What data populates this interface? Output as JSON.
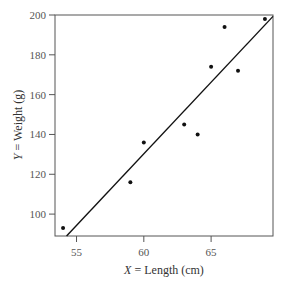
{
  "chart_data": {
    "type": "scatter",
    "title": "",
    "xlabel": "X = Length (cm)",
    "ylabel": "Y = Weight (g)",
    "xlabel_var": "X",
    "xlabel_text": " = Length (cm)",
    "ylabel_var": "Y",
    "ylabel_text": " = Weight (g)",
    "xlim": [
      53.4,
      69.6
    ],
    "ylim": [
      89,
      200
    ],
    "xticks": [
      55,
      60,
      65
    ],
    "yticks": [
      100,
      120,
      140,
      160,
      180,
      200
    ],
    "grid": false,
    "legend": null,
    "points": [
      {
        "x": 54,
        "y": 93
      },
      {
        "x": 59,
        "y": 116
      },
      {
        "x": 60,
        "y": 136
      },
      {
        "x": 63,
        "y": 145
      },
      {
        "x": 64,
        "y": 140
      },
      {
        "x": 65,
        "y": 174
      },
      {
        "x": 66,
        "y": 194
      },
      {
        "x": 67,
        "y": 172
      },
      {
        "x": 69,
        "y": 198
      }
    ],
    "regression_line": {
      "x0": 54.26,
      "y0": 89,
      "x1": 69.6,
      "y1": 199.3
    }
  }
}
